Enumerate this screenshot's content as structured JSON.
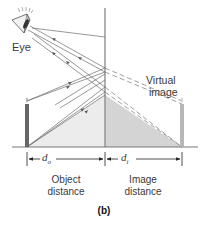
{
  "diagram": {
    "type": "plane-mirror-ray-diagram",
    "panel_label": "(b)",
    "labels": {
      "eye": "Eye",
      "virtual_image_line1": "Virtual",
      "virtual_image_line2": "image",
      "object_distance_symbol": "d",
      "object_distance_sub": "o",
      "image_distance_symbol": "d",
      "image_distance_sub": "i",
      "object_distance_line1": "Object",
      "object_distance_line2": "distance",
      "image_distance_line1": "Image",
      "image_distance_line2": "distance"
    },
    "colors": {
      "ray": "#6b6b6b",
      "mirror": "#8a8a8a",
      "object_triangle": "#ececec",
      "image_triangle": "#d6d6d6",
      "object": "#6a6a6a",
      "text": "#3a3a3a"
    }
  }
}
